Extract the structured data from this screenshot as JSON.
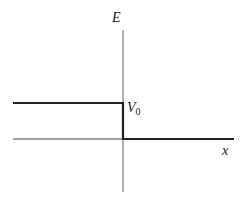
{
  "diagram": {
    "type": "potential-step",
    "labels": {
      "y_axis": "E",
      "x_axis": "x",
      "step_height": "V",
      "step_subscript": "0"
    },
    "colors": {
      "axis": "#555555",
      "curve": "#222222",
      "background": "#ffffff"
    }
  }
}
